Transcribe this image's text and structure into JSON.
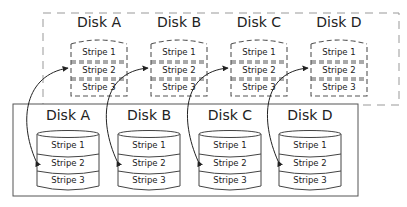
{
  "diagram": {
    "top_group": {
      "style": "dashed",
      "disks": [
        {
          "label": "Disk A",
          "stripes": [
            "Stripe 1",
            "Stripe 2",
            "Stripe 3"
          ]
        },
        {
          "label": "Disk B",
          "stripes": [
            "Stripe 1",
            "Stripe 2",
            "Stripe 3"
          ]
        },
        {
          "label": "Disk C",
          "stripes": [
            "Stripe 1",
            "Stripe 2",
            "Stripe 3"
          ]
        },
        {
          "label": "Disk D",
          "stripes": [
            "Stripe 1",
            "Stripe 2",
            "Stripe 3"
          ]
        }
      ]
    },
    "bottom_group": {
      "style": "solid",
      "disks": [
        {
          "label": "Disk A",
          "stripes": [
            "Stripe 1",
            "Stripe 2",
            "Stripe 3"
          ]
        },
        {
          "label": "Disk B",
          "stripes": [
            "Stripe 1",
            "Stripe 2",
            "Stripe 3"
          ]
        },
        {
          "label": "Disk C",
          "stripes": [
            "Stripe 1",
            "Stripe 2",
            "Stripe 3"
          ]
        },
        {
          "label": "Disk D",
          "stripes": [
            "Stripe 1",
            "Stripe 2",
            "Stripe 3"
          ]
        }
      ]
    },
    "connections": [
      {
        "from": "bottom Disk A Stripe 2",
        "to": "top Disk A Stripe 2"
      },
      {
        "from": "bottom Disk B Stripe 2",
        "to": "top Disk B Stripe 2"
      },
      {
        "from": "bottom Disk C Stripe 2",
        "to": "top Disk C Stripe 2"
      },
      {
        "from": "bottom Disk D Stripe 2",
        "to": "top Disk D Stripe 2"
      }
    ],
    "colors": {
      "line": "#333333",
      "dashed_box": "#999999",
      "background": "#ffffff"
    }
  }
}
